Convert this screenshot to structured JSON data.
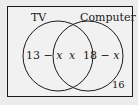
{
  "diagram": {
    "type": "venn",
    "sets": [
      {
        "label": "TV",
        "only_region": "13 − x"
      },
      {
        "label": "Computer",
        "only_region": "18 − x"
      }
    ],
    "intersection": "x",
    "outside": "16",
    "colors": {
      "background": "#ececec",
      "stroke": "#1a1a1a"
    }
  }
}
